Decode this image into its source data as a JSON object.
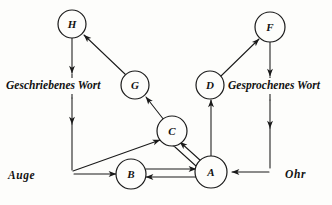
{
  "diagram": {
    "ink_color": "#1a1a1a",
    "paper_color": "#fdfdfb",
    "nodes": [
      {
        "id": "H",
        "label": "H",
        "cx": 72,
        "cy": 24,
        "r": 14
      },
      {
        "id": "F",
        "label": "F",
        "cx": 270,
        "cy": 27,
        "r": 15
      },
      {
        "id": "G",
        "label": "G",
        "cx": 135,
        "cy": 85,
        "r": 14
      },
      {
        "id": "D",
        "label": "D",
        "cx": 210,
        "cy": 85,
        "r": 14
      },
      {
        "id": "C",
        "label": "C",
        "cx": 172,
        "cy": 131,
        "r": 15
      },
      {
        "id": "B",
        "label": "B",
        "cx": 131,
        "cy": 174,
        "r": 15
      },
      {
        "id": "A",
        "label": "A",
        "cx": 211,
        "cy": 172,
        "r": 16
      }
    ],
    "text_labels": [
      {
        "name": "written-word-label",
        "text": "Geschriebenes Wort",
        "x": 6,
        "y": 89,
        "size": 11.5
      },
      {
        "name": "spoken-word-label",
        "text": "Gesprochenes Wort",
        "x": 228,
        "y": 89,
        "size": 11.5
      },
      {
        "name": "eye-label",
        "text": "Auge",
        "x": 8,
        "y": 179,
        "size": 12
      },
      {
        "name": "ear-label",
        "text": "Ohr",
        "x": 285,
        "y": 178,
        "size": 12
      }
    ],
    "edges": [
      {
        "name": "edge-H-to-written-word",
        "from": "H",
        "to": "Geschriebenes Wort",
        "direction": "down"
      },
      {
        "name": "edge-written-word-to-eye",
        "from": "Geschriebenes Wort",
        "to": "Auge",
        "direction": "down"
      },
      {
        "name": "edge-G-to-H",
        "from": "G",
        "to": "H",
        "direction": "up-left"
      },
      {
        "name": "edge-C-to-G",
        "from": "C",
        "to": "G",
        "direction": "up-left"
      },
      {
        "name": "edge-eye-to-C",
        "from": "Auge",
        "to": "C",
        "direction": "up-right"
      },
      {
        "name": "edge-eye-to-B",
        "from": "Auge",
        "to": "B",
        "direction": "right"
      },
      {
        "name": "edge-B-to-A",
        "from": "B",
        "to": "A",
        "direction": "right"
      },
      {
        "name": "edge-A-to-B",
        "from": "A",
        "to": "B",
        "direction": "left"
      },
      {
        "name": "edge-A-to-C",
        "from": "A",
        "to": "C",
        "direction": "up-left"
      },
      {
        "name": "edge-C-to-A",
        "from": "C",
        "to": "A",
        "direction": "down-right"
      },
      {
        "name": "edge-A-to-D",
        "from": "A",
        "to": "D",
        "direction": "up"
      },
      {
        "name": "edge-D-to-F",
        "from": "D",
        "to": "F",
        "direction": "up-right"
      },
      {
        "name": "edge-F-to-spoken-word",
        "from": "F",
        "to": "Gesprochenes Wort",
        "direction": "down"
      },
      {
        "name": "edge-spoken-word-to-ear",
        "from": "Gesprochenes Wort",
        "to": "Ohr",
        "direction": "down"
      },
      {
        "name": "edge-ear-to-A",
        "from": "Ohr",
        "to": "A",
        "direction": "left"
      }
    ]
  }
}
